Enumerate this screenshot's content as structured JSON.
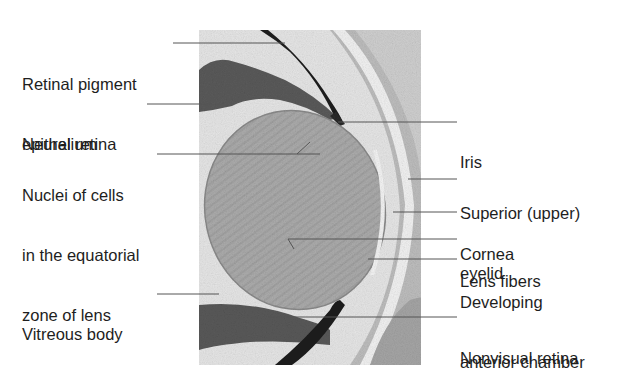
{
  "figure": {
    "colors": {
      "background": "#ffffff",
      "tissue_light": "#e4e4e4",
      "tissue_mid": "#b9b9b9",
      "lens": "#a9a9a9",
      "tissue_dark": "#5a5a5a",
      "pigment": "#1f1f1f",
      "leader_line": "#555555",
      "text": "#1e1e1e"
    }
  },
  "labels_left": [
    {
      "id": "retinal-pigment-epithelium",
      "lines": [
        "Retinal pigment",
        "epithelium"
      ]
    },
    {
      "id": "neural-retina",
      "lines": [
        "Neural retina"
      ]
    },
    {
      "id": "nuclei-equatorial-zone",
      "lines": [
        "Nuclei of cells",
        "in the equatorial",
        "zone of lens"
      ]
    },
    {
      "id": "vitreous-body",
      "lines": [
        "Vitreous body"
      ]
    }
  ],
  "labels_right": [
    {
      "id": "iris",
      "lines": [
        "Iris"
      ]
    },
    {
      "id": "superior-eyelid",
      "lines": [
        "Superior (upper)",
        "eyelid"
      ]
    },
    {
      "id": "cornea",
      "lines": [
        "Cornea"
      ]
    },
    {
      "id": "lens-fibers",
      "lines": [
        "Lens fibers"
      ]
    },
    {
      "id": "developing-anterior-chamber",
      "lines": [
        "Developing",
        "anterior chamber"
      ]
    },
    {
      "id": "nonvisual-retina",
      "lines": [
        "Nonvisual retina"
      ]
    }
  ]
}
